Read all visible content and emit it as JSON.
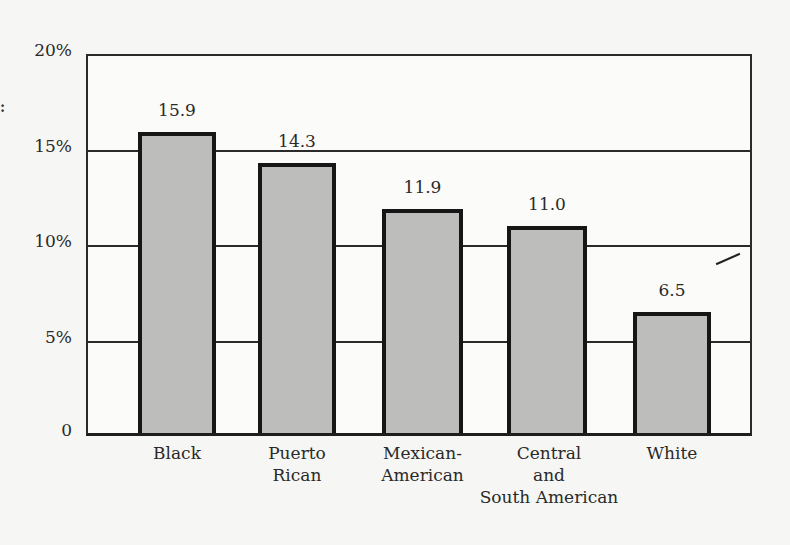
{
  "chart_data": {
    "type": "bar",
    "title": "",
    "xlabel": "",
    "ylabel": "",
    "ylim": [
      0,
      20
    ],
    "yticks": [
      {
        "value": 0,
        "label": "0"
      },
      {
        "value": 5,
        "label": "5%"
      },
      {
        "value": 10,
        "label": "10%"
      },
      {
        "value": 15,
        "label": "15%"
      },
      {
        "value": 20,
        "label": "20%"
      }
    ],
    "grid": "horizontal",
    "legend": "none",
    "categories": [
      "Black",
      "Puerto Rican",
      "Mexican-American",
      "Central and South American",
      "White"
    ],
    "category_label_lines": [
      [
        "Black"
      ],
      [
        "Puerto",
        "Rican"
      ],
      [
        "Mexican-",
        "American"
      ],
      [
        "Central",
        "and",
        "South American"
      ],
      [
        "White"
      ]
    ],
    "values": [
      15.9,
      14.3,
      11.9,
      11.0,
      6.5
    ],
    "value_labels": [
      "15.9",
      "14.3",
      "11.9",
      "11.0",
      "6.5"
    ],
    "colors": {
      "bar_fill": "#bdbdbb",
      "bar_edge": "#161616",
      "grid": "#2a2a2a"
    }
  }
}
